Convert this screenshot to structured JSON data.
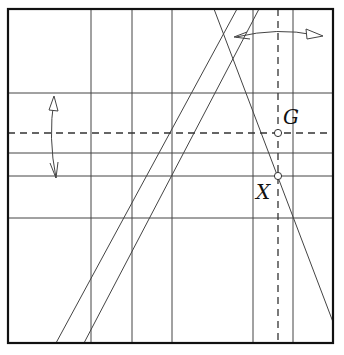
{
  "diagram": {
    "colors": {
      "line": "#333333",
      "border": "#111111",
      "background": "#ffffff"
    },
    "points": [
      {
        "id": "G",
        "label": "G"
      },
      {
        "id": "X",
        "label": "X"
      }
    ],
    "crease_lines": {
      "vertical": 5,
      "horizontal": 4,
      "diagonal": 3,
      "dashed_vertical": 1,
      "dashed_horizontal": 1
    },
    "arrows": [
      {
        "id": "fold-up-down",
        "type": "double-headed curved",
        "direction": "vertical"
      },
      {
        "id": "fold-left-right",
        "type": "double-headed curved",
        "direction": "horizontal"
      }
    ]
  }
}
